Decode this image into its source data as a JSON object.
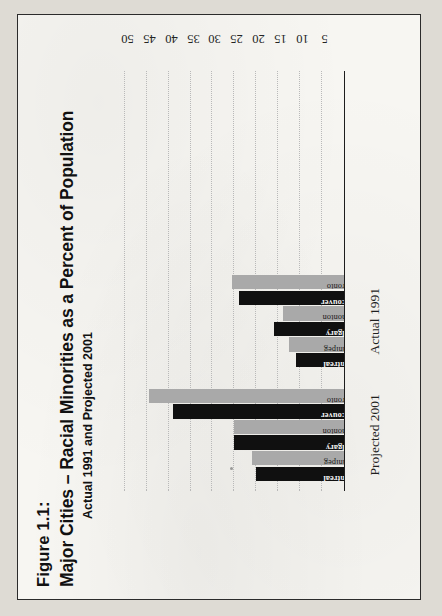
{
  "figure": {
    "number": "Figure 1.1:",
    "title": "Major Cities – Racial Minorities as a Percent of Population",
    "subtitle": "Actual 1991 and Projected 2001"
  },
  "colors": {
    "page": "#f7f6f2",
    "border": "#2b2b2b",
    "bar_dark": "#101010",
    "bar_light": "#a9a9a9",
    "gridline": "#b9b9b9",
    "axis": "#1d1d1d"
  },
  "chart_data": {
    "type": "bar",
    "orientation": "horizontal",
    "title": "Major Cities – Racial Minorities as a Percent of Population",
    "subtitle": "Actual 1991 and Projected 2001",
    "xlabel": "",
    "ylabel": "",
    "xlim": [
      0,
      52
    ],
    "ticks": [
      5,
      10,
      15,
      20,
      25,
      30,
      35,
      40,
      45,
      50
    ],
    "grid": true,
    "legend": "none",
    "groups": [
      {
        "name": "Projected 2001",
        "categories": [
          "Montreal",
          "Winnipeg",
          "Calgary",
          "Edmonton",
          "Vancouver",
          "Toronto"
        ],
        "values": [
          20,
          21,
          25,
          25,
          39,
          44.5
        ],
        "shades": [
          "dark",
          "light",
          "dark",
          "light",
          "dark",
          "light"
        ]
      },
      {
        "name": "Actual 1991",
        "categories": [
          "Montreal",
          "Winnipeg",
          "Calgary",
          "Edmonton",
          "Vancouver",
          "Toronto"
        ],
        "values": [
          11,
          12.5,
          16,
          14,
          24,
          25.5
        ],
        "shades": [
          "dark",
          "light",
          "dark",
          "light",
          "dark",
          "light"
        ]
      }
    ]
  }
}
